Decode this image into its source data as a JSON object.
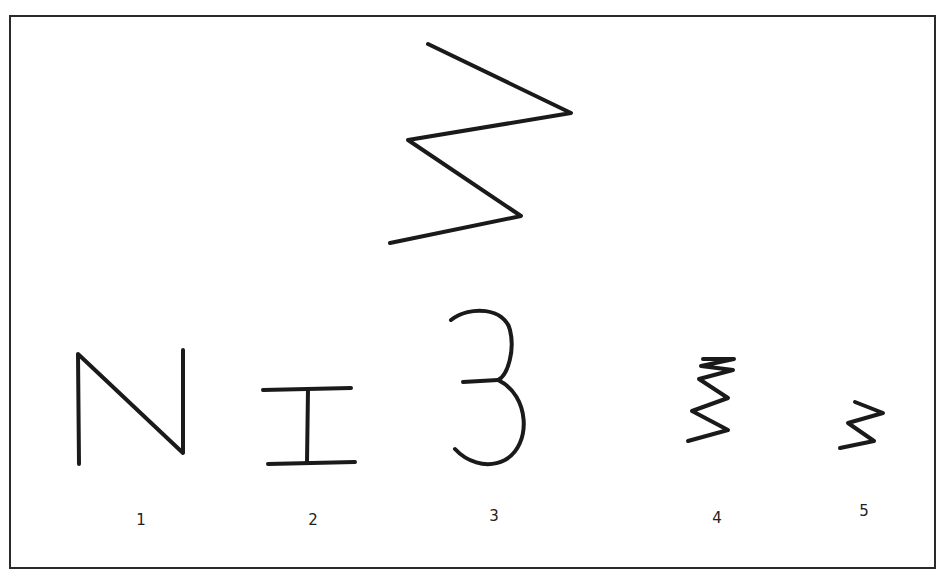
{
  "figure": {
    "top_shape": {
      "description": "large zigzag figure (sample)"
    },
    "stroke_color": "#1a1a1a",
    "items": [
      {
        "label": "1",
        "shape": "N-shape"
      },
      {
        "label": "2",
        "shape": "I-beam"
      },
      {
        "label": "3",
        "shape": "open 3-curve"
      },
      {
        "label": "4",
        "shape": "small dense zigzag"
      },
      {
        "label": "5",
        "shape": "small zigzag"
      }
    ]
  }
}
